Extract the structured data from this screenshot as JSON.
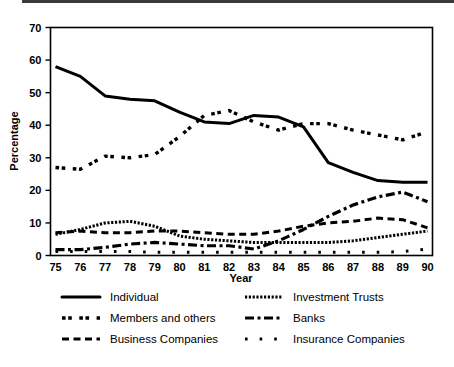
{
  "chart_data": {
    "type": "line",
    "title": "",
    "xlabel": "Year",
    "ylabel": "Percentage",
    "xlim": [
      75,
      90
    ],
    "ylim": [
      0,
      70
    ],
    "grid": false,
    "legend_position": "bottom",
    "x": [
      75,
      76,
      77,
      78,
      79,
      80,
      81,
      82,
      83,
      84,
      85,
      86,
      87,
      88,
      89,
      90
    ],
    "categories": [
      "75",
      "76",
      "77",
      "78",
      "79",
      "80",
      "81",
      "82",
      "83",
      "84",
      "85",
      "86",
      "87",
      "88",
      "89",
      "90"
    ],
    "ytick_labels": [
      "0",
      "10",
      "20",
      "30",
      "40",
      "50",
      "60",
      "70"
    ],
    "ytick_values": [
      0,
      10,
      20,
      30,
      40,
      50,
      60,
      70
    ],
    "series": [
      {
        "name": "Individual",
        "style": "solid",
        "color": "#000000",
        "values": [
          58.0,
          55.0,
          49.0,
          48.0,
          47.5,
          44.0,
          41.0,
          40.5,
          43.0,
          42.5,
          39.5,
          28.5,
          25.5,
          23.0,
          22.5,
          22.5
        ]
      },
      {
        "name": "Members and others",
        "style": "dash-dot-pairs",
        "color": "#000000",
        "values": [
          27.0,
          26.5,
          30.5,
          30.0,
          31.0,
          36.5,
          43.0,
          44.5,
          41.0,
          38.5,
          40.5,
          40.5,
          38.5,
          37.0,
          35.5,
          38.0
        ]
      },
      {
        "name": "Business Companies",
        "style": "dashed",
        "color": "#000000",
        "values": [
          7.0,
          7.5,
          7.0,
          7.0,
          7.5,
          7.5,
          7.0,
          6.5,
          6.5,
          7.5,
          9.0,
          10.0,
          10.5,
          11.5,
          11.0,
          8.5
        ]
      },
      {
        "name": "Investment Trusts",
        "style": "fine-dotted",
        "color": "#000000",
        "values": [
          6.5,
          8.0,
          10.0,
          10.5,
          9.0,
          6.0,
          5.0,
          4.5,
          4.0,
          4.0,
          4.0,
          4.0,
          4.5,
          5.5,
          6.5,
          7.5
        ]
      },
      {
        "name": "Banks",
        "style": "dash-dot",
        "color": "#000000",
        "values": [
          1.8,
          1.8,
          2.5,
          3.5,
          4.0,
          3.5,
          3.0,
          3.0,
          2.0,
          4.5,
          8.0,
          12.0,
          15.5,
          18.0,
          19.5,
          16.5
        ]
      },
      {
        "name": "Insurance Companies",
        "style": "sparse-dots",
        "color": "#000000",
        "values": [
          1.2,
          1.2,
          1.2,
          1.2,
          1.0,
          1.0,
          1.0,
          1.0,
          1.0,
          1.0,
          1.0,
          1.0,
          1.0,
          1.0,
          1.2,
          2.0
        ]
      }
    ]
  },
  "legend": {
    "entries": [
      {
        "label": "Individual",
        "style": "solid"
      },
      {
        "label": "Investment Trusts",
        "style": "fine-dotted"
      },
      {
        "label": "Members and others",
        "style": "dash-dot-pairs"
      },
      {
        "label": "Banks",
        "style": "dash-dot"
      },
      {
        "label": "Business Companies",
        "style": "dashed"
      },
      {
        "label": "Insurance Companies",
        "style": "sparse-dots"
      }
    ]
  }
}
